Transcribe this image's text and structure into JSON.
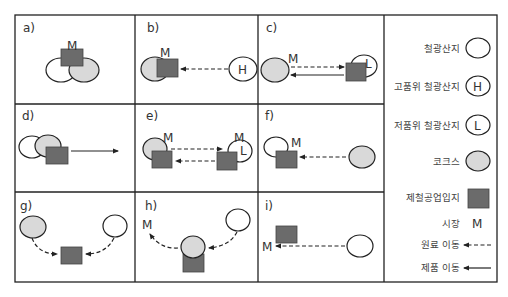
{
  "colors": {
    "border": "#222222",
    "factory": "#6b6b6b",
    "coke": "#d9d9d9",
    "ore": "#ffffff",
    "stroke": "#222222"
  },
  "panels": [
    {
      "id": "a",
      "label": "a)",
      "market": "M"
    },
    {
      "id": "b",
      "label": "b)",
      "market": "M",
      "ore_mark": "H"
    },
    {
      "id": "c",
      "label": "c)",
      "market": "M",
      "ore_mark": "L"
    },
    {
      "id": "d",
      "label": "d)"
    },
    {
      "id": "e",
      "label": "e)",
      "market_left": "M",
      "market_right": "M",
      "ore_mark": "L"
    },
    {
      "id": "f",
      "label": "f)",
      "market": "M"
    },
    {
      "id": "g",
      "label": "g)"
    },
    {
      "id": "h",
      "label": "h)",
      "market": "M"
    },
    {
      "id": "i",
      "label": "i)",
      "market": "M"
    }
  ],
  "legend": {
    "items": [
      {
        "label": "철광산지",
        "symbol": "ore-circle"
      },
      {
        "label": "고품위 철광산지",
        "symbol": "ore-circle-H",
        "mark": "H"
      },
      {
        "label": "저품위 철광산지",
        "symbol": "ore-circle-L",
        "mark": "L"
      },
      {
        "label": "코크스",
        "symbol": "coke-circle"
      },
      {
        "label": "제철공업입지",
        "symbol": "factory-square"
      },
      {
        "label": "시장",
        "symbol": "market-M",
        "mark": "M"
      },
      {
        "label": "원료 이동",
        "symbol": "dashed-arrow"
      },
      {
        "label": "제품 이동",
        "symbol": "solid-arrow"
      }
    ]
  }
}
